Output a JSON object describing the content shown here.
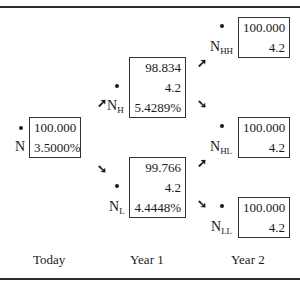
{
  "tree": {
    "nodes": {
      "N": {
        "label": "N",
        "sub": "",
        "values": [
          "100.000",
          "3.5000%"
        ]
      },
      "NH": {
        "label": "N",
        "sub": "H",
        "values": [
          "98.834",
          "4.2",
          "5.4289%"
        ]
      },
      "NL": {
        "label": "N",
        "sub": "L",
        "values": [
          "99.766",
          "4.2",
          "4.4448%"
        ]
      },
      "NHH": {
        "label": "N",
        "sub": "HH",
        "values": [
          "100.000",
          "4.2"
        ]
      },
      "NHL": {
        "label": "N",
        "sub": "HL",
        "values": [
          "100.000",
          "4.2"
        ]
      },
      "NLL": {
        "label": "N",
        "sub": "LL",
        "values": [
          "100.000",
          "4.2"
        ]
      }
    },
    "periods": [
      "Today",
      "Year 1",
      "Year 2"
    ],
    "arrows": {
      "up": "➚",
      "down": "➘"
    }
  }
}
